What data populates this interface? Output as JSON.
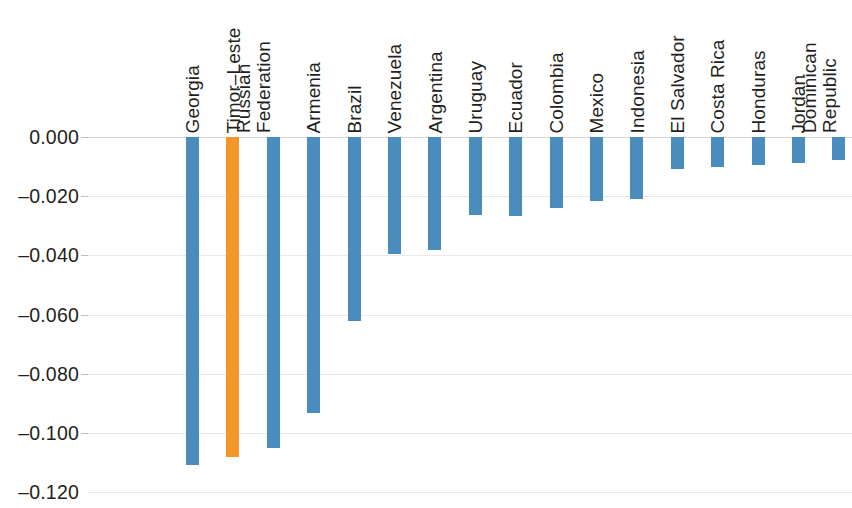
{
  "chart_data": {
    "type": "bar",
    "title": "",
    "subtitle": "",
    "xlabel": "",
    "ylabel": "",
    "orientation": "vertical",
    "grid": true,
    "legend": "none",
    "ylim": [
      -0.12,
      0.0
    ],
    "ytick_labels": [
      "0.000",
      "-0.020",
      "-0.040",
      "-0.060",
      "-0.080",
      "-0.100",
      "-0.120"
    ],
    "ytick_values": [
      0.0,
      -0.02,
      -0.04,
      -0.06,
      -0.08,
      -0.1,
      -0.12
    ],
    "categories": [
      "Georgia",
      "Timor-Leste",
      "Russian\nFederation",
      "Armenia",
      "Brazil",
      "Venezuela",
      "Argentina",
      "Uruguay",
      "Ecuador",
      "Colombia",
      "Mexico",
      "Indonesia",
      "El Salvador",
      "Costa Rica",
      "Honduras",
      "Jordan",
      "Dominican\nRepublic",
      "Chile",
      "Bolivia",
      "Tunisia"
    ],
    "values": [
      -0.1108,
      -0.1081,
      -0.1051,
      -0.0932,
      -0.0622,
      -0.0395,
      -0.0382,
      -0.0264,
      -0.0267,
      -0.024,
      -0.0216,
      -0.0209,
      -0.0108,
      -0.0101,
      -0.0095,
      -0.0088,
      -0.0078,
      -0.0071,
      -0.0057,
      -0.0034
    ],
    "highlight_index": 1,
    "colors": {
      "bar_default": "#4a8cbe",
      "bar_highlight": "#f5962b",
      "gridline": "#e9e9ea",
      "zero_line": "#d8d8da",
      "text": "#231f20",
      "background": "#ffffff"
    }
  }
}
